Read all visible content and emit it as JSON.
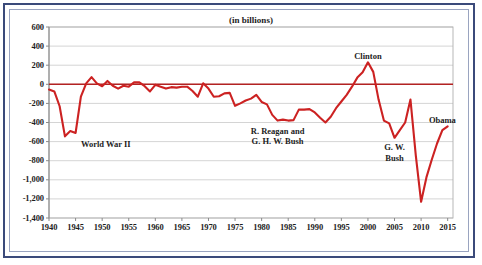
{
  "chart_data": {
    "type": "line",
    "title": "(in billions)",
    "xlabel": "",
    "ylabel": "",
    "xlim": [
      1940,
      2016
    ],
    "ylim": [
      -1400,
      600
    ],
    "grid": true,
    "legend": false,
    "legend_position": "none",
    "line_color": "#cc2222",
    "zero_line_color": "#b32222",
    "gridline_color": "#c9c9c9",
    "x_tick_labels": [
      "1940",
      "1945",
      "1950",
      "1955",
      "1960",
      "1965",
      "1970",
      "1975",
      "1980",
      "1985",
      "1990",
      "1995",
      "2000",
      "2005",
      "2010",
      "2015"
    ],
    "x_tick_values": [
      1940,
      1945,
      1950,
      1955,
      1960,
      1965,
      1970,
      1975,
      1980,
      1985,
      1990,
      1995,
      2000,
      2005,
      2010,
      2015
    ],
    "y_tick_labels": [
      "600",
      "400",
      "200",
      "0",
      "-200",
      "-400",
      "-600",
      "-800",
      "-1,000",
      "-1,200",
      "-1,400"
    ],
    "y_tick_values": [
      600,
      400,
      200,
      0,
      -200,
      -400,
      -600,
      -800,
      -1000,
      -1200,
      -1400
    ],
    "x": [
      1940,
      1941,
      1942,
      1943,
      1944,
      1945,
      1946,
      1947,
      1948,
      1949,
      1950,
      1951,
      1952,
      1953,
      1954,
      1955,
      1956,
      1957,
      1958,
      1959,
      1960,
      1961,
      1962,
      1963,
      1964,
      1965,
      1966,
      1967,
      1968,
      1969,
      1970,
      1971,
      1972,
      1973,
      1974,
      1975,
      1976,
      1977,
      1978,
      1979,
      1980,
      1981,
      1982,
      1983,
      1984,
      1985,
      1986,
      1987,
      1988,
      1989,
      1990,
      1991,
      1992,
      1993,
      1994,
      1995,
      1996,
      1997,
      1998,
      1999,
      2000,
      2001,
      2002,
      2003,
      2004,
      2005,
      2006,
      2007,
      2008,
      2009,
      2010,
      2011,
      2012,
      2013,
      2014,
      2015
    ],
    "values": [
      -55,
      -75,
      -230,
      -545,
      -490,
      -510,
      -130,
      10,
      75,
      10,
      -20,
      35,
      -15,
      -45,
      -15,
      -25,
      20,
      20,
      -20,
      -75,
      -5,
      -25,
      -45,
      -30,
      -35,
      -25,
      -25,
      -70,
      -130,
      10,
      -45,
      -130,
      -125,
      -95,
      -90,
      -225,
      -200,
      -170,
      -150,
      -110,
      -185,
      -210,
      -320,
      -380,
      -370,
      -380,
      -375,
      -265,
      -265,
      -260,
      -295,
      -350,
      -400,
      -340,
      -250,
      -180,
      -110,
      -25,
      70,
      125,
      230,
      130,
      -160,
      -380,
      -410,
      -560,
      -480,
      -400,
      -160,
      -745,
      -1230,
      -975,
      -790,
      -620,
      -480,
      -440
    ],
    "annotations": [
      {
        "text": "World War II",
        "x_value": 1946,
        "y_value": -640,
        "align": "left"
      },
      {
        "text": "R. Reagan and\nG. H. W. Bush",
        "x_value": 1983,
        "y_value": -495,
        "align": "center"
      },
      {
        "text": "Clinton",
        "x_value": 2000,
        "y_value": 290,
        "align": "center"
      },
      {
        "text": "G. W.\nBush",
        "x_value": 2005,
        "y_value": -670,
        "align": "center"
      },
      {
        "text": "Obama",
        "x_value": 2014,
        "y_value": -385,
        "align": "center"
      }
    ]
  },
  "annotation_labels": {
    "world_war_2": "World War II",
    "reagan_bush_line1": "R. Reagan and",
    "reagan_bush_line2": "G. H. W. Bush",
    "clinton": "Clinton",
    "gw_bush_line1": "G. W.",
    "gw_bush_line2": "Bush",
    "obama": "Obama"
  }
}
